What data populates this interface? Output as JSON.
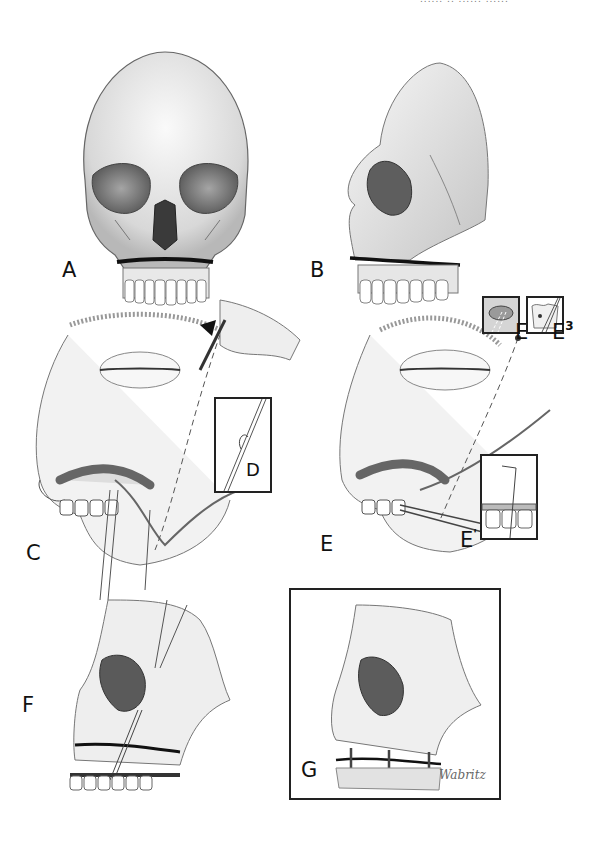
{
  "header": {
    "text": "...... .. ...... ......"
  },
  "panels": [
    {
      "id": "A",
      "label": "A",
      "description": "Frontal view of skull with Le Fort I maxillary fracture line"
    },
    {
      "id": "B",
      "label": "B",
      "description": "Oblique lateral view of skull with maxillary fracture"
    },
    {
      "id": "C",
      "label": "C",
      "description": "Surgical view: wire passed through cheek via needle into oral cavity"
    },
    {
      "id": "D",
      "label": "D",
      "description": "Inset: wire loop detail"
    },
    {
      "id": "E",
      "label": "E",
      "description": "Surgical view: wire retrieval with forceps in oral vestibule"
    },
    {
      "id": "E1",
      "label": "E",
      "sup": "'",
      "description": "Inset: wire around dental arch bar"
    },
    {
      "id": "E2",
      "label": "E",
      "sup": "2",
      "description": "Inset: suspension wire at orbital rim"
    },
    {
      "id": "E3",
      "label": "E",
      "sup": "3",
      "description": "Inset: wire through zygomatic bone"
    },
    {
      "id": "F",
      "label": "F",
      "description": "Skeletal view with circumzygomatic suspension wires and arch bar"
    },
    {
      "id": "G",
      "label": "G",
      "description": "Framed view of fixed maxilla with interosseous wires"
    }
  ],
  "signature": "Wabritz",
  "colors": {
    "ink": "#111111",
    "shade": "#8a8a8a",
    "light": "#d6d6d6",
    "paper": "#ffffff"
  }
}
